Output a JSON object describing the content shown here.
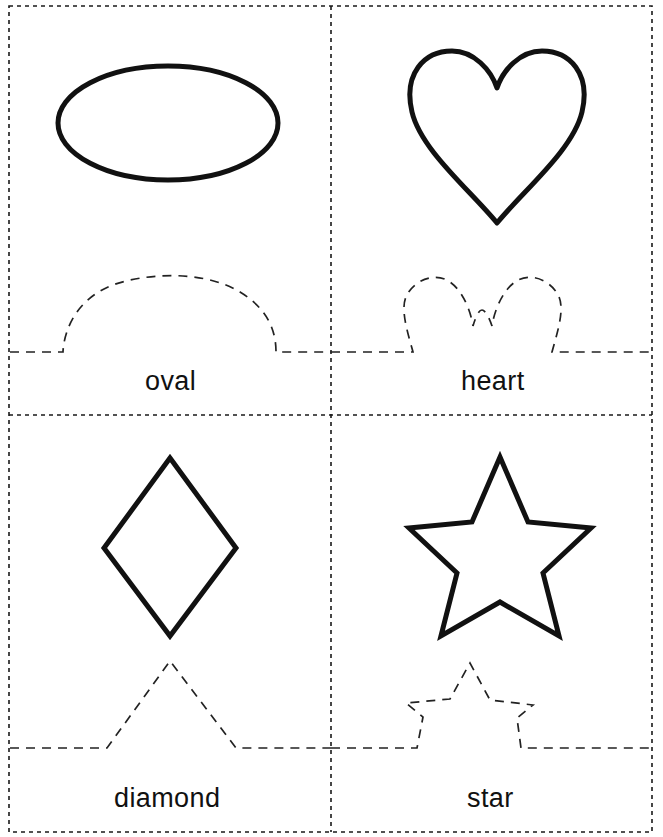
{
  "worksheet": {
    "page_width": 663,
    "page_height": 837,
    "background_color": "#ffffff",
    "outline_color": "#1a1a1a",
    "cut_line_color": "#222222",
    "shape_stroke_color": "#111111",
    "border": {
      "x": 9,
      "y": 6,
      "width": 643,
      "height": 826,
      "dash": "4 4",
      "stroke_width": 1.6
    },
    "dividers": {
      "vertical_x": 331,
      "horizontal_y": 415,
      "dash": "4 4",
      "stroke_width": 1.6
    }
  },
  "cards": [
    {
      "id": "oval",
      "label": "oval",
      "shape_name": "oval-shape",
      "cut_guide_name": "oval-cut-guide",
      "label_x": 145,
      "label_y": 368,
      "fold_line_y": 352,
      "column": 0,
      "row": 0
    },
    {
      "id": "heart",
      "label": "heart",
      "shape_name": "heart-shape",
      "cut_guide_name": "heart-cut-guide",
      "label_x": 461,
      "label_y": 368,
      "fold_line_y": 352,
      "column": 1,
      "row": 0
    },
    {
      "id": "diamond",
      "label": "diamond",
      "shape_name": "diamond-shape",
      "cut_guide_name": "diamond-cut-guide",
      "label_x": 114,
      "label_y": 785,
      "fold_line_y": 748,
      "column": 0,
      "row": 1
    },
    {
      "id": "star",
      "label": "star",
      "shape_name": "star-shape",
      "cut_guide_name": "star-cut-guide",
      "label_x": 467,
      "label_y": 785,
      "fold_line_y": 748,
      "column": 1,
      "row": 1
    }
  ],
  "geometry": {
    "oval": {
      "cx": 168,
      "cy": 123,
      "rx": 110,
      "ry": 57,
      "stroke_width": 5
    },
    "heart": {
      "path": "M 497 223 C 470 190 421 150 412 112 C 403 74 424 51 452 51 C 474 51 491 70 497 88 C 503 70 520 51 542 51 C 570 51 591 74 582 112 C 573 150 524 190 497 223 Z",
      "stroke_width": 5
    },
    "diamond": {
      "points": "170,458 236,548 170,636 104,548",
      "stroke_width": 5
    },
    "star": {
      "points": "500,457 528,522 591,528 543,573 559,636 500,602 441,636 457,573 409,528 472,522",
      "stroke_width": 5
    },
    "cut_guides": {
      "oval": "M 10 352 L 63 352 C 63 352 63 296 126 281 C 168 271 212 275 240 292 C 268 309 276 331 276 352 L 331 352",
      "heart": "M 331 352 L 413 352 C 407 330 399 306 408 293 C 417 279 436 272 450 282 C 463 291 471 312 473 326 C 476 316 479 310 482 310 C 485 310 489 317 492 326 C 494 312 502 291 515 282 C 529 272 548 279 557 293 C 566 306 558 330 552 352 L 652 352",
      "diamond": "M 10 748 L 107 748 L 170 661 L 236 748 L 331 748",
      "star": "M 331 748 L 417 748 L 423 717 L 406 703 L 450 699 L 470 663 L 490 700 L 533 705 L 517 718 L 521 748 L 652 748"
    }
  }
}
